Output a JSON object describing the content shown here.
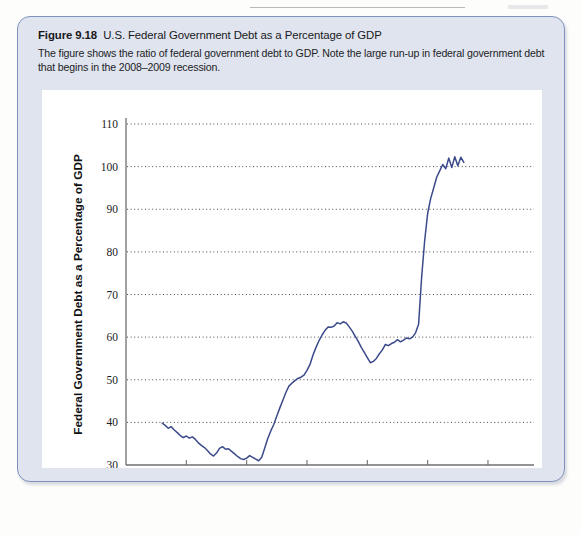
{
  "figure": {
    "label": "Figure 9.18",
    "title": "U.S. Federal Government Debt as a Percentage of GDP",
    "description": "The figure shows the ratio of federal government debt to GDP. Note the large run-up in federal government debt that begins in the 2008–2009 recession."
  },
  "colors": {
    "line": "#3b4a8a",
    "panel_fill": "#dfe4ef",
    "panel_border": "#7f92bc",
    "plot_bg": "#ffffff",
    "gridline": "#4a4a4a",
    "axis": "#6f6f6f"
  },
  "chart_data": {
    "type": "line",
    "title": "U.S. Federal Government Debt as a Percentage of GDP",
    "xlabel": "Year",
    "ylabel": "Federal Government Debt as a Percentage of GDP",
    "xlim": [
      1960,
      2021
    ],
    "ylim": [
      30,
      110
    ],
    "xticks": [
      1960,
      1970,
      1980,
      1990,
      2000,
      2010,
      2020
    ],
    "yticks": [
      30,
      40,
      50,
      60,
      70,
      80,
      90,
      100,
      110
    ],
    "grid": "horizontal-dotted",
    "legend": "none",
    "series": [
      {
        "name": "Federal Government Debt as a Percentage of GDP",
        "x": [
          1966.0,
          1966.5,
          1967.0,
          1967.5,
          1968.0,
          1968.5,
          1969.0,
          1969.5,
          1970.0,
          1970.5,
          1971.0,
          1971.5,
          1972.0,
          1972.5,
          1973.0,
          1973.5,
          1974.0,
          1974.5,
          1975.0,
          1975.5,
          1976.0,
          1976.5,
          1977.0,
          1977.5,
          1978.0,
          1978.5,
          1979.0,
          1979.5,
          1980.0,
          1980.5,
          1981.0,
          1981.5,
          1982.0,
          1982.5,
          1983.0,
          1983.5,
          1984.0,
          1984.5,
          1985.0,
          1985.5,
          1986.0,
          1986.5,
          1987.0,
          1987.5,
          1988.0,
          1988.5,
          1989.0,
          1989.5,
          1990.0,
          1990.5,
          1991.0,
          1991.5,
          1992.0,
          1992.5,
          1993.0,
          1993.5,
          1994.0,
          1994.5,
          1995.0,
          1995.5,
          1996.0,
          1996.5,
          1997.0,
          1997.5,
          1998.0,
          1998.5,
          1999.0,
          1999.5,
          2000.0,
          2000.5,
          2001.0,
          2001.5,
          2002.0,
          2002.5,
          2003.0,
          2003.5,
          2004.0,
          2004.5,
          2005.0,
          2005.5,
          2006.0,
          2006.5,
          2007.0,
          2007.5,
          2008.0,
          2008.5,
          2009.0,
          2009.5,
          2010.0,
          2010.5,
          2011.0,
          2011.5,
          2012.0,
          2012.5,
          2013.0,
          2013.5,
          2014.0,
          2014.5,
          2015.0,
          2015.5,
          2016.0
        ],
        "y": [
          39.8,
          39.3,
          38.6,
          39.0,
          38.2,
          37.6,
          36.9,
          36.4,
          36.8,
          36.3,
          36.6,
          36.0,
          35.2,
          34.6,
          34.1,
          33.4,
          32.6,
          32.1,
          32.8,
          33.9,
          34.3,
          33.7,
          33.8,
          33.2,
          32.6,
          32.0,
          31.5,
          31.3,
          31.6,
          32.2,
          31.8,
          31.4,
          31.0,
          31.8,
          34.0,
          36.2,
          38.0,
          39.5,
          41.5,
          43.4,
          45.2,
          47.0,
          48.5,
          49.2,
          49.8,
          50.3,
          50.6,
          51.1,
          52.2,
          53.6,
          55.8,
          57.6,
          59.2,
          60.5,
          61.6,
          62.4,
          62.3,
          62.6,
          63.4,
          63.1,
          63.6,
          63.3,
          62.4,
          61.4,
          60.2,
          59.0,
          57.6,
          56.4,
          55.2,
          54.0,
          54.3,
          55.0,
          56.1,
          57.0,
          58.3,
          58.0,
          58.5,
          58.8,
          59.4,
          58.9,
          59.3,
          59.8,
          59.6,
          60.0,
          61.0,
          63.0,
          74.0,
          82.5,
          89.0,
          92.5,
          95.0,
          97.5,
          99.0,
          100.5,
          99.5,
          102.0,
          99.8,
          102.3,
          100.2,
          102.2,
          101.0
        ]
      }
    ],
    "annotations": []
  },
  "axis_labels": {
    "y": [
      "110",
      "100",
      "90",
      "80",
      "70",
      "60",
      "50",
      "40",
      "30"
    ],
    "x": [
      "1960",
      "1970",
      "1980",
      "1990",
      "2000",
      "2010",
      "2020"
    ],
    "x_title": "Year",
    "y_title": "Federal Government Debt as a Percentage of GDP"
  }
}
